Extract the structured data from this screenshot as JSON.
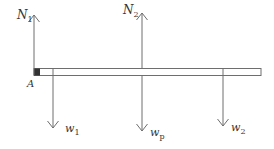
{
  "diagram": {
    "type": "free-body-diagram",
    "colors": {
      "line": "#6e6e6e",
      "block": "#333333",
      "text": "#333333",
      "background": "#ffffff"
    },
    "beam": {
      "label": "beam"
    },
    "point": {
      "label": "A"
    },
    "forces": [
      {
        "id": "N1",
        "symbol": "N",
        "subscript": "1",
        "direction": "up"
      },
      {
        "id": "N2",
        "symbol": "N",
        "subscript": "2",
        "direction": "up"
      },
      {
        "id": "w1",
        "symbol": "w",
        "subscript": "1",
        "direction": "down"
      },
      {
        "id": "wp",
        "symbol": "w",
        "subscript": "p",
        "direction": "down"
      },
      {
        "id": "w2",
        "symbol": "w",
        "subscript": "2",
        "direction": "down"
      }
    ]
  }
}
